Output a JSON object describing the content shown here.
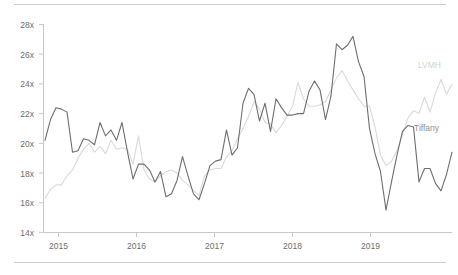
{
  "chart_data": {
    "type": "line",
    "title": "",
    "subtitle": "",
    "xlabel": "",
    "ylabel": "",
    "ylim": [
      14,
      28
    ],
    "xlim": [
      "2014-10",
      "2019-11"
    ],
    "grid": false,
    "legend_position": "inline-right",
    "y_ticks": [
      "14x",
      "16x",
      "18x",
      "20x",
      "22x",
      "24x",
      "26x",
      "28x"
    ],
    "y_tick_values": [
      14,
      16,
      18,
      20,
      22,
      24,
      26,
      28
    ],
    "x_ticks": [
      "2015",
      "2016",
      "2017",
      "2018",
      "2019"
    ],
    "x_tick_values": [
      2015,
      2016,
      2017,
      2018,
      2019
    ],
    "value_suffix": "x",
    "series": [
      {
        "name": "Tiffany",
        "color": "#6e6e6e",
        "label_color": "#8f8f8f",
        "values": [
          20.2,
          21.6,
          22.4,
          22.3,
          22.1,
          19.4,
          19.5,
          20.3,
          20.2,
          19.9,
          21.4,
          20.5,
          20.9,
          20.2,
          21.4,
          19.4,
          17.6,
          18.6,
          18.6,
          18.2,
          17.4,
          18.1,
          16.4,
          16.6,
          17.5,
          19.1,
          17.8,
          16.6,
          16.2,
          17.3,
          18.5,
          18.8,
          18.9,
          20.9,
          19.2,
          19.7,
          22.7,
          23.7,
          23.3,
          21.5,
          22.7,
          20.8,
          23.0,
          22.4,
          21.9,
          21.9,
          22.0,
          22.0,
          23.5,
          24.2,
          23.6,
          21.6,
          23.2,
          26.7,
          26.3,
          26.6,
          27.2,
          25.5,
          24.5,
          21.0,
          19.3,
          18.1,
          15.5,
          17.4,
          19.2,
          20.8,
          21.2,
          21.1,
          17.4,
          18.3,
          18.3,
          17.3,
          16.8,
          17.9,
          19.4
        ]
      },
      {
        "name": "LVMH",
        "color": "#d9d9d9",
        "label_color": "#d2d2d2",
        "values": [
          16.3,
          16.9,
          17.2,
          17.2,
          17.8,
          18.2,
          19.0,
          19.6,
          20.0,
          19.4,
          19.8,
          19.3,
          20.2,
          19.6,
          19.7,
          19.6,
          18.6,
          20.5,
          18.2,
          17.6,
          17.4,
          17.8,
          18.1,
          18.2,
          18.0,
          17.5,
          17.2,
          16.8,
          16.5,
          17.8,
          18.2,
          18.3,
          18.3,
          19.1,
          19.5,
          20.3,
          21.0,
          21.8,
          22.8,
          22.3,
          21.4,
          21.3,
          20.7,
          21.2,
          21.8,
          22.5,
          24.1,
          23.0,
          22.5,
          22.5,
          22.6,
          22.8,
          23.6,
          24.4,
          24.9,
          24.2,
          23.6,
          23.0,
          22.5,
          22.5,
          21.1,
          19.2,
          18.5,
          18.8,
          19.5,
          20.6,
          21.7,
          22.2,
          22.0,
          23.1,
          22.1,
          23.4,
          24.3,
          23.3,
          24.0
        ]
      }
    ],
    "annotations": [
      {
        "text": "LVMH",
        "series": "LVMH"
      },
      {
        "text": "Tiffany",
        "series": "Tiffany"
      }
    ]
  },
  "labels": {
    "y": [
      "28x",
      "26x",
      "24x",
      "22x",
      "20x",
      "18x",
      "16x",
      "14x"
    ],
    "x": [
      "2015",
      "2016",
      "2017",
      "2018",
      "2019"
    ],
    "lvmh": "LVMH",
    "tiffany": "Tiffany"
  },
  "colors": {
    "tiffany_line": "#6e6e6e",
    "lvmh_line": "#d9d9d9",
    "axis": "#c8c8c8",
    "rule": "#cfcfcf",
    "tick_text": "#6e6e6e"
  }
}
